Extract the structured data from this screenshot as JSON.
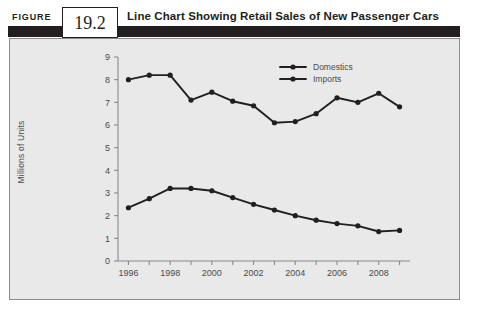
{
  "figure": {
    "label": "FIGURE",
    "number": "19.2",
    "title": "Line Chart Showing Retail Sales of New Passenger Cars"
  },
  "colors": {
    "header_bar": "#231f20",
    "panel_background": "#e9e9e9",
    "panel_border": "#8d8d8d",
    "axis": "#8a8a8a",
    "series": "#231f20",
    "tick_text": "#4a4a4a"
  },
  "chart_data": {
    "type": "line",
    "title": "Line Chart Showing Retail Sales of New Passenger Cars",
    "xlabel": "",
    "ylabel": "Millions of Units",
    "x": [
      1996,
      1997,
      1998,
      1999,
      2000,
      2001,
      2002,
      2003,
      2004,
      2005,
      2006,
      2007,
      2008,
      2009
    ],
    "xtick_labels": [
      "1996",
      "1998",
      "2000",
      "2002",
      "2004",
      "2006",
      "2008"
    ],
    "xtick_values": [
      1996,
      1998,
      2000,
      2002,
      2004,
      2006,
      2008
    ],
    "xlim": [
      1995.5,
      2009.5
    ],
    "ytick_labels": [
      "0",
      "1",
      "2",
      "3",
      "4",
      "5",
      "6",
      "7",
      "8",
      "9"
    ],
    "ytick_values": [
      0,
      1,
      2,
      3,
      4,
      5,
      6,
      7,
      8,
      9
    ],
    "ylim": [
      0,
      9
    ],
    "grid": false,
    "legend_position": "top-right",
    "series": [
      {
        "name": "Domestics",
        "values": [
          8.0,
          8.2,
          8.2,
          7.1,
          7.45,
          7.05,
          6.85,
          6.1,
          6.15,
          6.5,
          7.2,
          7.0,
          7.4,
          6.8
        ]
      },
      {
        "name": "Imports",
        "values": [
          2.35,
          2.75,
          3.2,
          3.2,
          3.1,
          2.8,
          2.5,
          2.25,
          2.0,
          1.8,
          1.65,
          1.55,
          1.3,
          1.35
        ]
      }
    ]
  }
}
